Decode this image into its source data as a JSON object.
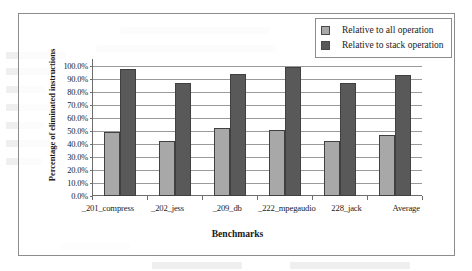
{
  "chart_data": {
    "type": "bar",
    "title": "",
    "xlabel": "Benchmarks",
    "ylabel": "Percentage of eliminated instructions",
    "categories": [
      "_201_compress",
      "_202_jess",
      "_209_db",
      "_222_mpegaudio",
      "228_jack",
      "Average"
    ],
    "series": [
      {
        "name": "Relative to all operation",
        "color": "#a8a8a8",
        "values": [
          49.0,
          42.0,
          52.0,
          51.0,
          42.0,
          47.0
        ]
      },
      {
        "name": "Relative to stack operation",
        "color": "#595959",
        "values": [
          98.0,
          87.0,
          94.0,
          99.0,
          87.0,
          93.0
        ]
      }
    ],
    "ylim": [
      0,
      100
    ],
    "ytick_labels": [
      "100.0%",
      "90.0%",
      "80.0%",
      "70.0%",
      "60.0%",
      "50.0%",
      "40.0%",
      "30.0%",
      "20.0%",
      "10.0%",
      "0.0%"
    ],
    "ytick_values": [
      100,
      90,
      80,
      70,
      60,
      50,
      40,
      30,
      20,
      10,
      0
    ],
    "grid": true,
    "legend_position": "top-right"
  },
  "legend": {
    "items": [
      {
        "label": "Relative to all operation",
        "swatch": "light"
      },
      {
        "label": "Relative to stack operation",
        "swatch": "dark"
      }
    ]
  },
  "colors": {
    "series_light": "#a8a8a8",
    "series_dark": "#595959",
    "frame": "#8d8d8d",
    "grid": "#9a9a9a",
    "axis": "#6d6d6d"
  }
}
